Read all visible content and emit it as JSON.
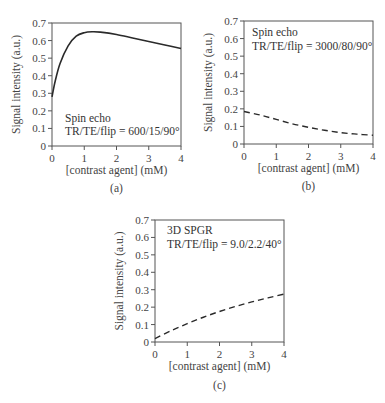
{
  "chart_data": [
    {
      "id": "a",
      "type": "line",
      "panel_label": "(a)",
      "title": "",
      "xlabel": "[contrast agent] (mM)",
      "ylabel": "Signal intensity (a.u.)",
      "xlim": [
        0,
        4
      ],
      "ylim": [
        0,
        0.7
      ],
      "xticks": [
        "0",
        "1",
        "2",
        "3",
        "4"
      ],
      "yticks": [
        "0",
        "0.1",
        "0.2",
        "0.3",
        "0.4",
        "0.5",
        "0.6",
        "0.7"
      ],
      "grid": false,
      "line_style": "solid",
      "annotation": [
        "Spin echo",
        "TR/TE/flip = 600/15/90°"
      ],
      "series": [
        {
          "name": "Spin echo TR/TE/flip = 600/15/90°",
          "x": [
            0,
            0.1,
            0.25,
            0.5,
            0.75,
            1.0,
            1.25,
            1.5,
            2.0,
            2.5,
            3.0,
            3.5,
            4.0
          ],
          "values": [
            0.28,
            0.37,
            0.47,
            0.57,
            0.625,
            0.645,
            0.65,
            0.648,
            0.635,
            0.615,
            0.595,
            0.575,
            0.555
          ]
        }
      ]
    },
    {
      "id": "b",
      "type": "line",
      "panel_label": "(b)",
      "title": "",
      "xlabel": "[contrast agent] (mM)",
      "ylabel": "Signal intensity (a.u.)",
      "xlim": [
        0,
        4
      ],
      "ylim": [
        0,
        0.7
      ],
      "xticks": [
        "0",
        "1",
        "2",
        "3",
        "4"
      ],
      "yticks": [
        "0",
        "0.1",
        "0.2",
        "0.3",
        "0.4",
        "0.5",
        "0.6",
        "0.7"
      ],
      "grid": false,
      "line_style": "dashed",
      "annotation": [
        "Spin echo",
        "TR/TE/flip = 3000/80/90°"
      ],
      "series": [
        {
          "name": "Spin echo TR/TE/flip = 3000/80/90°",
          "x": [
            0,
            0.5,
            1.0,
            1.5,
            2.0,
            2.5,
            3.0,
            3.5,
            4.0
          ],
          "values": [
            0.185,
            0.165,
            0.14,
            0.115,
            0.095,
            0.078,
            0.065,
            0.056,
            0.05
          ]
        }
      ]
    },
    {
      "id": "c",
      "type": "line",
      "panel_label": "(c)",
      "title": "",
      "xlabel": "[contrast agent] (mM)",
      "ylabel": "Signal intensity (a.u.)",
      "xlim": [
        0,
        4
      ],
      "ylim": [
        0,
        0.7
      ],
      "xticks": [
        "0",
        "1",
        "2",
        "3",
        "4"
      ],
      "yticks": [
        "0",
        "0.1",
        "0.2",
        "0.3",
        "0.4",
        "0.5",
        "0.6",
        "0.7"
      ],
      "grid": false,
      "line_style": "dashed",
      "annotation": [
        "3D SPGR",
        "TR/TE/flip = 9.0/2.2/40°"
      ],
      "series": [
        {
          "name": "3D SPGR TR/TE/flip = 9.0/2.2/40°",
          "x": [
            0,
            0.5,
            1.0,
            1.5,
            2.0,
            2.5,
            3.0,
            3.5,
            4.0
          ],
          "values": [
            0.02,
            0.065,
            0.105,
            0.142,
            0.175,
            0.204,
            0.23,
            0.253,
            0.275
          ]
        }
      ]
    }
  ]
}
